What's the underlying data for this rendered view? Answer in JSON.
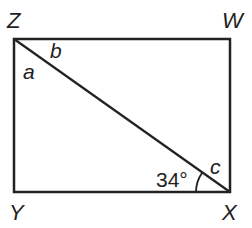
{
  "diagram": {
    "type": "geometry-rectangle-with-diagonal",
    "stroke_color": "#222222",
    "background": "#ffffff",
    "vertices": [
      {
        "id": "Z",
        "label": "Z",
        "x": 14,
        "y": 39
      },
      {
        "id": "W",
        "label": "W",
        "x": 230,
        "y": 39
      },
      {
        "id": "X",
        "label": "X",
        "x": 230,
        "y": 192
      },
      {
        "id": "Y",
        "label": "Y",
        "x": 14,
        "y": 192
      }
    ],
    "edges": [
      {
        "from": "Z",
        "to": "W"
      },
      {
        "from": "W",
        "to": "X"
      },
      {
        "from": "X",
        "to": "Y"
      },
      {
        "from": "Y",
        "to": "Z"
      },
      {
        "from": "Z",
        "to": "X",
        "role": "diagonal"
      }
    ],
    "angle_labels": {
      "a": "a",
      "b": "b",
      "c": "c",
      "given": "34°"
    }
  }
}
